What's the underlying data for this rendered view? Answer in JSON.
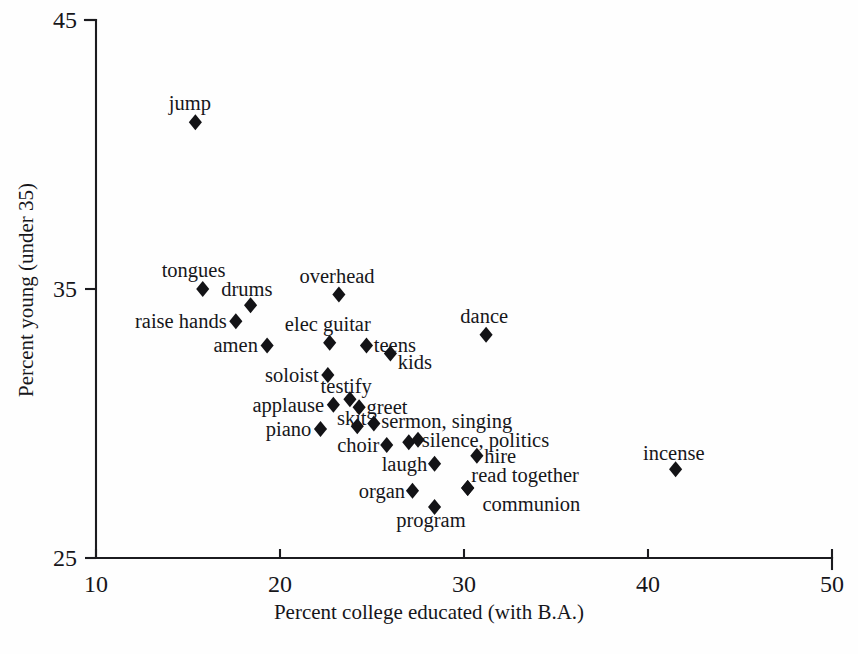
{
  "chart_data": {
    "type": "scatter",
    "title": "",
    "xlabel": "Percent college educated (with B.A.)",
    "ylabel": "Percent young (under 35)",
    "xlim": [
      10,
      50
    ],
    "ylim": [
      25,
      45
    ],
    "xticks": [
      "10",
      "20",
      "30",
      "40",
      "50"
    ],
    "yticks": [
      "25",
      "35",
      "45"
    ],
    "grid": false,
    "legend": "none",
    "marker_shape": "diamond",
    "marker_color": "#131316",
    "points": [
      {
        "label": "jump",
        "x": 15.4,
        "y": 41.2,
        "lx": 15.1,
        "ly": 41.9,
        "anchor": "mid"
      },
      {
        "label": "tongues",
        "x": 15.8,
        "y": 35.0,
        "lx": 15.3,
        "ly": 35.7,
        "anchor": "mid"
      },
      {
        "label": "drums",
        "x": 18.4,
        "y": 34.4,
        "lx": 18.2,
        "ly": 35.0,
        "anchor": "mid"
      },
      {
        "label": "raise hands",
        "x": 17.6,
        "y": 33.8,
        "lx": 17.1,
        "ly": 33.8,
        "anchor": "end"
      },
      {
        "label": "amen",
        "x": 19.3,
        "y": 32.9,
        "lx": 18.8,
        "ly": 32.9,
        "anchor": "end"
      },
      {
        "label": "overhead",
        "x": 23.2,
        "y": 34.8,
        "lx": 23.1,
        "ly": 35.5,
        "anchor": "mid"
      },
      {
        "label": "dance",
        "x": 31.2,
        "y": 33.3,
        "lx": 31.1,
        "ly": 34.0,
        "anchor": "mid"
      },
      {
        "label": "elec guitar",
        "x": 22.7,
        "y": 33.0,
        "lx": 22.6,
        "ly": 33.7,
        "anchor": "mid"
      },
      {
        "label": "teens",
        "x": 24.7,
        "y": 32.9,
        "lx": 25.1,
        "ly": 32.9,
        "anchor": "start"
      },
      {
        "label": "kids",
        "x": 26.0,
        "y": 32.6,
        "lx": 26.4,
        "ly": 32.3,
        "anchor": "start"
      },
      {
        "label": "soloist",
        "x": 22.6,
        "y": 31.8,
        "lx": 22.1,
        "ly": 31.8,
        "anchor": "end"
      },
      {
        "label": "testify",
        "x": 23.8,
        "y": 30.9,
        "lx": 23.6,
        "ly": 31.4,
        "anchor": "mid"
      },
      {
        "label": "applause",
        "x": 22.9,
        "y": 30.7,
        "lx": 22.4,
        "ly": 30.7,
        "anchor": "end"
      },
      {
        "label": "greet",
        "x": 24.3,
        "y": 30.6,
        "lx": 24.7,
        "ly": 30.6,
        "anchor": "start"
      },
      {
        "label": "skit",
        "x": 24.2,
        "y": 29.9,
        "lx": 23.9,
        "ly": 30.2,
        "anchor": "mid"
      },
      {
        "label": "piano",
        "x": 22.2,
        "y": 29.8,
        "lx": 21.7,
        "ly": 29.8,
        "anchor": "end"
      },
      {
        "label": "sermon, singing",
        "x": 25.1,
        "y": 30.0,
        "lx": 25.5,
        "ly": 30.1,
        "anchor": "start"
      },
      {
        "label": "choir",
        "x": 25.8,
        "y": 29.2,
        "lx": 25.4,
        "ly": 29.2,
        "anchor": "end"
      },
      {
        "label": "silence, politics",
        "x": 27.0,
        "y": 29.3,
        "lx": 27.7,
        "ly": 29.4,
        "anchor": "start"
      },
      {
        "label": "hire",
        "x": 30.7,
        "y": 28.8,
        "lx": 31.1,
        "ly": 28.8,
        "anchor": "start"
      },
      {
        "label": "laugh",
        "x": 28.4,
        "y": 28.5,
        "lx": 28.0,
        "ly": 28.5,
        "anchor": "end"
      },
      {
        "label": "read together",
        "x": 30.2,
        "y": 27.6,
        "lx": 30.4,
        "ly": 28.1,
        "anchor": "start"
      },
      {
        "label": "organ",
        "x": 27.2,
        "y": 27.5,
        "lx": 26.8,
        "ly": 27.5,
        "anchor": "end"
      },
      {
        "label": "program",
        "x": 28.4,
        "y": 26.9,
        "lx": 28.2,
        "ly": 26.4,
        "anchor": "mid"
      },
      {
        "label": "communion",
        "x": 30.2,
        "y": 27.6,
        "lx": 31.0,
        "ly": 27.0,
        "anchor": "start"
      },
      {
        "label": "incense",
        "x": 41.5,
        "y": 28.3,
        "lx": 41.4,
        "ly": 28.9,
        "anchor": "mid"
      }
    ],
    "extra_markers": [
      {
        "name": "silence-politics-overlap",
        "x": 27.5,
        "y": 29.4
      }
    ]
  }
}
